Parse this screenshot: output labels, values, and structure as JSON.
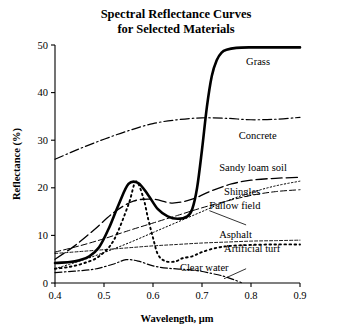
{
  "chart_data": {
    "type": "line",
    "title": "Spectral Reflectance Curves for Selected Materials",
    "title_lines": [
      "Spectral Reflectance Curves",
      "for Selected Materials"
    ],
    "xlabel": "Wavelength, μm",
    "ylabel": "Reflectance (%)",
    "xlim": [
      0.4,
      0.9
    ],
    "ylim": [
      0,
      50
    ],
    "xticks": [
      0.4,
      0.5,
      0.6,
      0.7,
      0.8,
      0.9
    ],
    "xtick_labels": [
      "0.4",
      "0.5",
      "0.6",
      "0.7",
      "0.8",
      "0.9"
    ],
    "yticks": [
      0,
      10,
      20,
      30,
      40,
      50
    ],
    "ytick_labels": [
      "0",
      "10",
      "20",
      "30",
      "40",
      "50"
    ],
    "grid": false,
    "legend": "inline-annotations",
    "series": [
      {
        "name": "Grass",
        "style": "solid-thick",
        "stroke_width": 2.6,
        "dash": "none",
        "label_x": 0.79,
        "label_y": 46.5,
        "x": [
          0.4,
          0.43,
          0.45,
          0.47,
          0.49,
          0.51,
          0.53,
          0.55,
          0.57,
          0.59,
          0.61,
          0.63,
          0.65,
          0.67,
          0.68,
          0.69,
          0.7,
          0.71,
          0.72,
          0.73,
          0.74,
          0.75,
          0.77,
          0.8,
          0.85,
          0.9
        ],
        "y": [
          4.2,
          4.4,
          4.8,
          5.6,
          7.5,
          11.5,
          16.5,
          20.8,
          21.0,
          18.5,
          15.5,
          14.0,
          13.5,
          14.0,
          15.5,
          20.0,
          28.0,
          37.0,
          43.5,
          46.8,
          48.4,
          49.0,
          49.4,
          49.5,
          49.5,
          49.5
        ]
      },
      {
        "name": "Concrete",
        "style": "dash-dot",
        "stroke_width": 1.2,
        "dash": "9,3,1.5,3",
        "label_x": 0.775,
        "label_y": 31.0,
        "x": [
          0.4,
          0.45,
          0.5,
          0.55,
          0.6,
          0.65,
          0.7,
          0.75,
          0.8,
          0.85,
          0.9
        ],
        "y": [
          26.0,
          28.2,
          30.2,
          32.0,
          33.5,
          34.3,
          34.7,
          34.6,
          34.3,
          34.4,
          34.8
        ]
      },
      {
        "name": "Sandy loam soil",
        "style": "long-dash",
        "stroke_width": 1.3,
        "dash": "11,4",
        "label_x": 0.735,
        "label_y": 24.2,
        "x": [
          0.4,
          0.44,
          0.48,
          0.52,
          0.56,
          0.6,
          0.64,
          0.68,
          0.72,
          0.76,
          0.8,
          0.85,
          0.9
        ],
        "y": [
          5.0,
          7.8,
          11.2,
          14.8,
          17.2,
          17.6,
          16.8,
          17.6,
          19.4,
          20.8,
          21.6,
          22.0,
          22.2
        ]
      },
      {
        "name": "Shingles",
        "style": "medium-dash",
        "stroke_width": 1.0,
        "dash": "6,3",
        "label_x": 0.745,
        "label_y": 19.3,
        "x": [
          0.4,
          0.45,
          0.5,
          0.55,
          0.6,
          0.65,
          0.7,
          0.75,
          0.8,
          0.85,
          0.9
        ],
        "y": [
          6.5,
          7.8,
          9.3,
          11.0,
          12.6,
          14.2,
          15.8,
          17.2,
          18.4,
          19.2,
          19.6
        ]
      },
      {
        "name": "Fallow field",
        "style": "fine-dot",
        "stroke_width": 1.0,
        "dash": "1.4,2.2",
        "label_x": 0.715,
        "label_y": 16.4,
        "x": [
          0.4,
          0.45,
          0.5,
          0.55,
          0.6,
          0.65,
          0.7,
          0.75,
          0.8,
          0.85,
          0.9
        ],
        "y": [
          3.0,
          4.6,
          6.4,
          8.4,
          10.6,
          12.8,
          15.0,
          17.2,
          19.0,
          20.4,
          21.4
        ]
      },
      {
        "name": "Asphalt",
        "style": "fine-dash",
        "stroke_width": 0.9,
        "dash": "3,2",
        "label_x": 0.735,
        "label_y": 10.2,
        "x": [
          0.4,
          0.45,
          0.5,
          0.55,
          0.6,
          0.65,
          0.7,
          0.75,
          0.8,
          0.85,
          0.9
        ],
        "y": [
          6.2,
          6.6,
          7.0,
          7.4,
          7.8,
          8.1,
          8.4,
          8.6,
          8.8,
          8.9,
          9.0
        ]
      },
      {
        "name": "Artificial turf",
        "style": "coarse-dot",
        "stroke_width": 1.9,
        "dash": "1.6,3.4",
        "label_x": 0.745,
        "label_y": 7.3,
        "x": [
          0.4,
          0.43,
          0.46,
          0.49,
          0.52,
          0.55,
          0.565,
          0.58,
          0.59,
          0.6,
          0.61,
          0.625,
          0.645,
          0.66,
          0.68,
          0.7,
          0.73,
          0.76,
          0.8,
          0.85,
          0.9
        ],
        "y": [
          3.0,
          3.4,
          4.2,
          5.6,
          9.0,
          16.5,
          21.3,
          18.0,
          13.5,
          9.5,
          6.0,
          4.6,
          4.5,
          5.2,
          5.6,
          6.5,
          7.4,
          7.8,
          8.0,
          8.1,
          8.1
        ]
      },
      {
        "name": "Clear water",
        "style": "dash-dot-water",
        "stroke_width": 1.2,
        "dash": "7,2.5,1.5,2.5",
        "label_x": 0.655,
        "label_y": 3.3,
        "x": [
          0.4,
          0.44,
          0.48,
          0.52,
          0.545,
          0.57,
          0.6,
          0.63,
          0.66,
          0.69,
          0.72,
          0.745,
          0.765,
          0.78
        ],
        "y": [
          2.2,
          2.5,
          2.9,
          4.0,
          4.9,
          4.6,
          3.6,
          3.1,
          2.9,
          2.6,
          2.0,
          1.4,
          0.7,
          0.1
        ]
      }
    ],
    "leaders": [
      {
        "from_x": 0.715,
        "from_y": 15.2,
        "to_x": 0.79,
        "to_y": 12.2,
        "name": "fallow-field-leader"
      },
      {
        "from_x": 0.745,
        "from_y": 0.9,
        "to_x": 0.79,
        "to_y": 3.0,
        "name": "clear-water-leader"
      }
    ],
    "colors": {
      "ink": "#000000",
      "background": "#ffffff"
    }
  }
}
